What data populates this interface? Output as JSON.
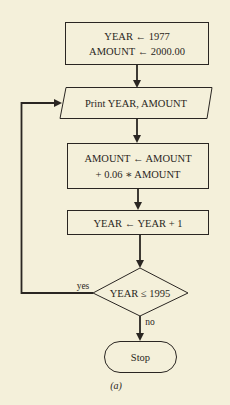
{
  "figure": {
    "caption": "(a)",
    "nodes": {
      "init": {
        "type": "process",
        "lines": [
          "YEAR ← 1977",
          "AMOUNT ← 2000.00"
        ]
      },
      "print": {
        "type": "input-output",
        "lines": [
          "Print YEAR, AMOUNT"
        ]
      },
      "update_amount": {
        "type": "process",
        "lines": [
          "AMOUNT ← AMOUNT",
          "+ 0.06 ∗ AMOUNT"
        ]
      },
      "increment_year": {
        "type": "process",
        "lines": [
          "YEAR ← YEAR + 1"
        ]
      },
      "decision": {
        "type": "decision",
        "lines": [
          "YEAR ≤ 1995"
        ]
      },
      "stop": {
        "type": "terminal",
        "lines": [
          "Stop"
        ]
      }
    },
    "edges": [
      {
        "from": "init",
        "to": "print",
        "label": ""
      },
      {
        "from": "print",
        "to": "update_amount",
        "label": ""
      },
      {
        "from": "update_amount",
        "to": "increment_year",
        "label": ""
      },
      {
        "from": "increment_year",
        "to": "decision",
        "label": ""
      },
      {
        "from": "decision",
        "to": "print",
        "label": "yes"
      },
      {
        "from": "decision",
        "to": "stop",
        "label": "no"
      }
    ]
  }
}
